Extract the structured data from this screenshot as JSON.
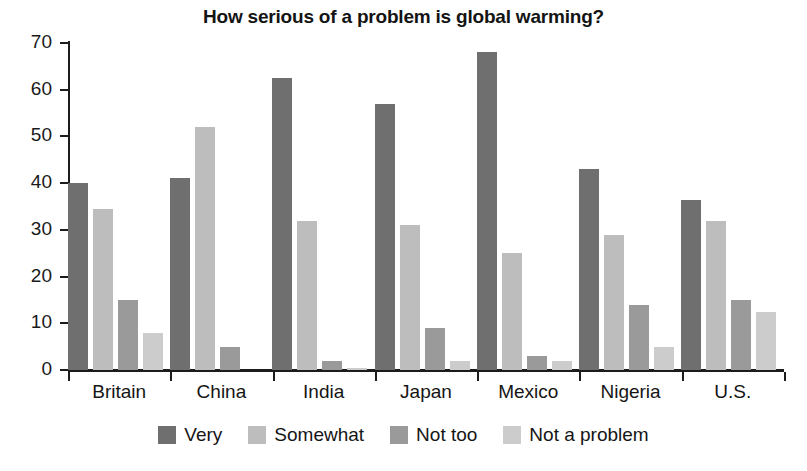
{
  "chart_data": {
    "type": "bar",
    "title": "How serious of a problem is global warming?",
    "xlabel": "",
    "ylabel": "",
    "ylim": [
      0,
      70
    ],
    "ytick_step": 10,
    "grid": false,
    "legend_position": "bottom",
    "categories": [
      "Britain",
      "China",
      "India",
      "Japan",
      "Mexico",
      "Nigeria",
      "U.S."
    ],
    "series": [
      {
        "name": "Very",
        "color": "#6f6f6f",
        "values": [
          40,
          41,
          62.5,
          57,
          68,
          43,
          36.5
        ]
      },
      {
        "name": "Somewhat",
        "color": "#bdbdbd",
        "values": [
          34.5,
          52,
          32,
          31,
          25,
          29,
          32
        ]
      },
      {
        "name": "Not too",
        "color": "#9a9a9a",
        "values": [
          15,
          5,
          2,
          9,
          3,
          14,
          15
        ]
      },
      {
        "name": "Not a problem",
        "color": "#cccccc",
        "values": [
          8,
          0,
          0.5,
          2,
          2,
          5,
          12.5
        ]
      }
    ],
    "ytick_labels": [
      "0",
      "10",
      "20",
      "30",
      "40",
      "50",
      "60",
      "70"
    ]
  }
}
